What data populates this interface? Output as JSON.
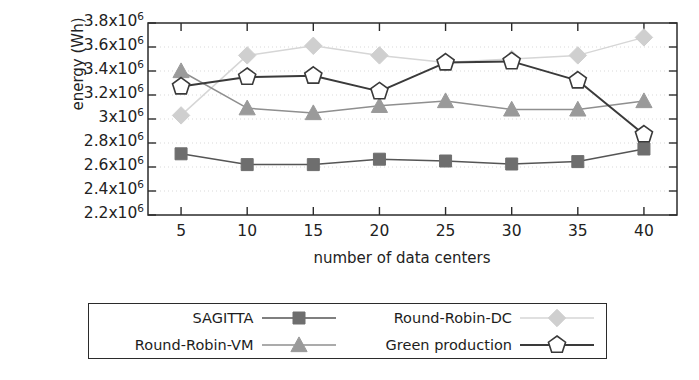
{
  "chart_data": {
    "type": "line",
    "title": "",
    "xlabel": "number of data centers",
    "ylabel": "energy (Wh)",
    "x": [
      5,
      10,
      15,
      20,
      25,
      30,
      35,
      40
    ],
    "xtick_labels": [
      "5",
      "10",
      "15",
      "20",
      "25",
      "30",
      "35",
      "40"
    ],
    "xlim": [
      2.5,
      42.5
    ],
    "ylim": [
      2200000,
      3800000
    ],
    "ytick_values": [
      2200000,
      2400000,
      2600000,
      2800000,
      3000000,
      3200000,
      3400000,
      3600000,
      3800000
    ],
    "ytick_labels": [
      {
        "mantissa": "2.2x10",
        "exponent": "6"
      },
      {
        "mantissa": "2.4x10",
        "exponent": "6"
      },
      {
        "mantissa": "2.6x10",
        "exponent": "6"
      },
      {
        "mantissa": "2.8x10",
        "exponent": "6"
      },
      {
        "mantissa": "3x10",
        "exponent": "6"
      },
      {
        "mantissa": "3.2x10",
        "exponent": "6"
      },
      {
        "mantissa": "3.4x10",
        "exponent": "6"
      },
      {
        "mantissa": "3.6x10",
        "exponent": "6"
      },
      {
        "mantissa": "3.8x10",
        "exponent": "6"
      }
    ],
    "grid": true,
    "legend_position": "below-outside",
    "series": [
      {
        "name": "SAGITTA",
        "marker": "square",
        "color": "#6e6e6e",
        "line_color": "#555555",
        "values": [
          2710000,
          2620000,
          2620000,
          2665000,
          2650000,
          2625000,
          2645000,
          2750000
        ]
      },
      {
        "name": "Round-Robin-DC",
        "marker": "diamond",
        "color": "#cfcfcf",
        "line_color": "#d6d6d6",
        "values": [
          3030000,
          3530000,
          3610000,
          3530000,
          3470000,
          3500000,
          3530000,
          3680000
        ]
      },
      {
        "name": "Round-Robin-VM",
        "marker": "triangle",
        "color": "#9a9a9a",
        "line_color": "#8f8f8f",
        "values": [
          3400000,
          3090000,
          3050000,
          3110000,
          3150000,
          3080000,
          3080000,
          3150000
        ]
      },
      {
        "name": "Green production",
        "marker": "pentagon-open",
        "color": "#ffffff",
        "line_color": "#3a3a3a",
        "values": [
          3270000,
          3350000,
          3360000,
          3230000,
          3470000,
          3480000,
          3320000,
          2870000
        ]
      }
    ]
  },
  "axes": {
    "frame_color": "#2b2b2b",
    "grid_color": "#d9d9d9"
  }
}
